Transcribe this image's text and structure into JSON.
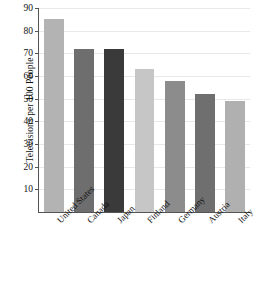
{
  "chart_data": {
    "type": "bar",
    "title": "",
    "xlabel": "",
    "ylabel": "Televisions per 100 People",
    "categories": [
      "United States",
      "Canada",
      "Japan",
      "Finland",
      "Germany",
      "Austria",
      "Italy"
    ],
    "values": [
      85,
      72,
      72,
      63,
      58,
      52,
      49
    ],
    "bar_colors": [
      "#b3b3b3",
      "#6e6e6e",
      "#3a3a3a",
      "#c6c6c6",
      "#8c8c8c",
      "#6f6f6f",
      "#b0b0b0"
    ],
    "ylim": [
      0,
      90
    ],
    "yticks": [
      10,
      20,
      30,
      40,
      50,
      60,
      70,
      80,
      90
    ],
    "ytick_labels": [
      "10",
      "20",
      "30",
      "40",
      "50",
      "60",
      "70",
      "80",
      "90"
    ],
    "grid": true,
    "legend": null,
    "xtick_rotation": -45
  },
  "figure": {
    "source_caption": ""
  }
}
